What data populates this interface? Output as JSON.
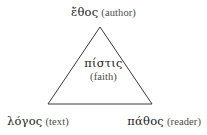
{
  "figure": {
    "name": "rhetorical-triangle",
    "background_color": "#ffffff",
    "width": 207,
    "height": 135
  },
  "triangle": {
    "stroke_color": "#3a3a3a",
    "stroke_width": 1,
    "fill": "none",
    "apex": {
      "x": 100,
      "y": 27
    },
    "base_left": {
      "x": 48,
      "y": 104
    },
    "base_right": {
      "x": 152,
      "y": 104
    }
  },
  "labels": {
    "apex": {
      "greek": "ἔθος",
      "english": "(author)"
    },
    "center": {
      "greek": "πίστις",
      "english": "(faith)"
    },
    "bottom_left": {
      "greek": "λόγος",
      "english": "(text)"
    },
    "bottom_right": {
      "greek": "πάθος",
      "english": "(reader)"
    }
  },
  "colors": {
    "greek_text": "#1b1b1b",
    "english_text": "#4a4a4a",
    "line": "#3a3a3a"
  }
}
